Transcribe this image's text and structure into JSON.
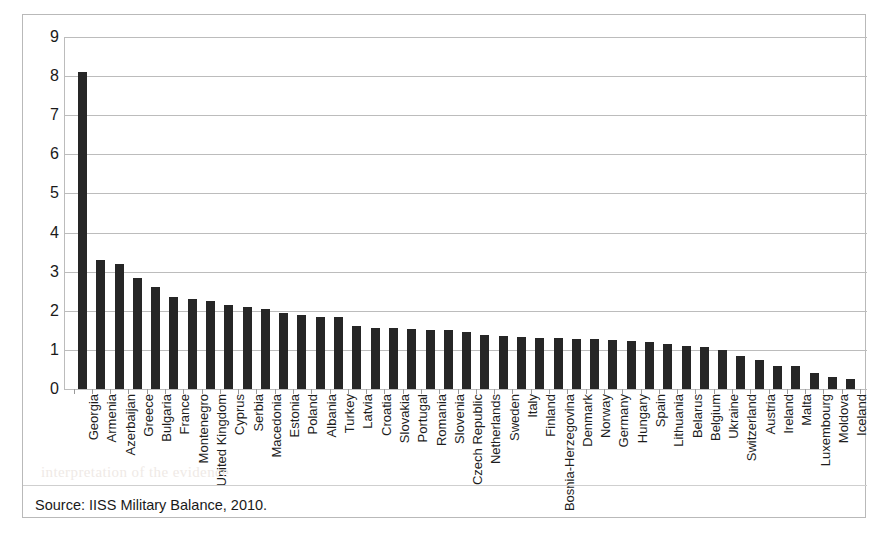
{
  "figure": {
    "source_note": "Source: IISS Military Balance, 2010.",
    "ghost_text": "interpretation of the evidence",
    "frame_color": "#b9b9b9",
    "bar_color": "#262626",
    "gridline_color": "#bcbcbc"
  },
  "chart_data": {
    "type": "bar",
    "title": "",
    "subtitle": "",
    "xlabel": "",
    "ylabel": "",
    "ylim": [
      0,
      9
    ],
    "yticks": [
      0,
      1,
      2,
      3,
      4,
      5,
      6,
      7,
      8,
      9
    ],
    "ytick_labels": [
      "0",
      "1",
      "2",
      "3",
      "4",
      "5",
      "6",
      "7",
      "8",
      "9"
    ],
    "grid": true,
    "legend": false,
    "legend_position": "none",
    "orientation": "vertical",
    "categories": [
      "Georgia",
      "Armenia",
      "Azerbaijan",
      "Greece",
      "Bulgaria",
      "France",
      "Montenegro",
      "United Kingdom",
      "Cyprus",
      "Serbia",
      "Macedonia",
      "Estonia",
      "Poland",
      "Albania",
      "Turkey",
      "Latvia",
      "Croatia",
      "Slovakia",
      "Portugal",
      "Romania",
      "Slovenia",
      "Czech Republic",
      "Netherlands",
      "Sweden",
      "Italy",
      "Finland",
      "Bosnia-Herzegovina",
      "Denmark",
      "Norway",
      "Germany",
      "Hungary",
      "Spain",
      "Lithuania",
      "Belarus",
      "Belgium",
      "Ukraine",
      "Switzerland",
      "Austria",
      "Ireland",
      "Malta",
      "Luxembourg",
      "Moldova",
      "Iceland"
    ],
    "values": [
      8.1,
      3.3,
      3.2,
      2.85,
      2.6,
      2.35,
      2.3,
      2.25,
      2.15,
      2.1,
      2.05,
      1.95,
      1.9,
      1.85,
      1.85,
      1.6,
      1.57,
      1.55,
      1.53,
      1.52,
      1.5,
      1.45,
      1.38,
      1.35,
      1.32,
      1.3,
      1.3,
      1.29,
      1.27,
      1.25,
      1.23,
      1.2,
      1.15,
      1.1,
      1.08,
      1.0,
      0.85,
      0.75,
      0.6,
      0.6,
      0.42,
      0.3,
      0.25
    ],
    "series": [
      {
        "name": "Defence expenditure as % of GDP",
        "values": [
          8.1,
          3.3,
          3.2,
          2.85,
          2.6,
          2.35,
          2.3,
          2.25,
          2.15,
          2.1,
          2.05,
          1.95,
          1.9,
          1.85,
          1.85,
          1.6,
          1.57,
          1.55,
          1.53,
          1.52,
          1.5,
          1.45,
          1.38,
          1.35,
          1.32,
          1.3,
          1.3,
          1.29,
          1.27,
          1.25,
          1.23,
          1.2,
          1.15,
          1.1,
          1.08,
          1.0,
          0.85,
          0.75,
          0.6,
          0.6,
          0.42,
          0.3,
          0.25
        ]
      }
    ]
  }
}
